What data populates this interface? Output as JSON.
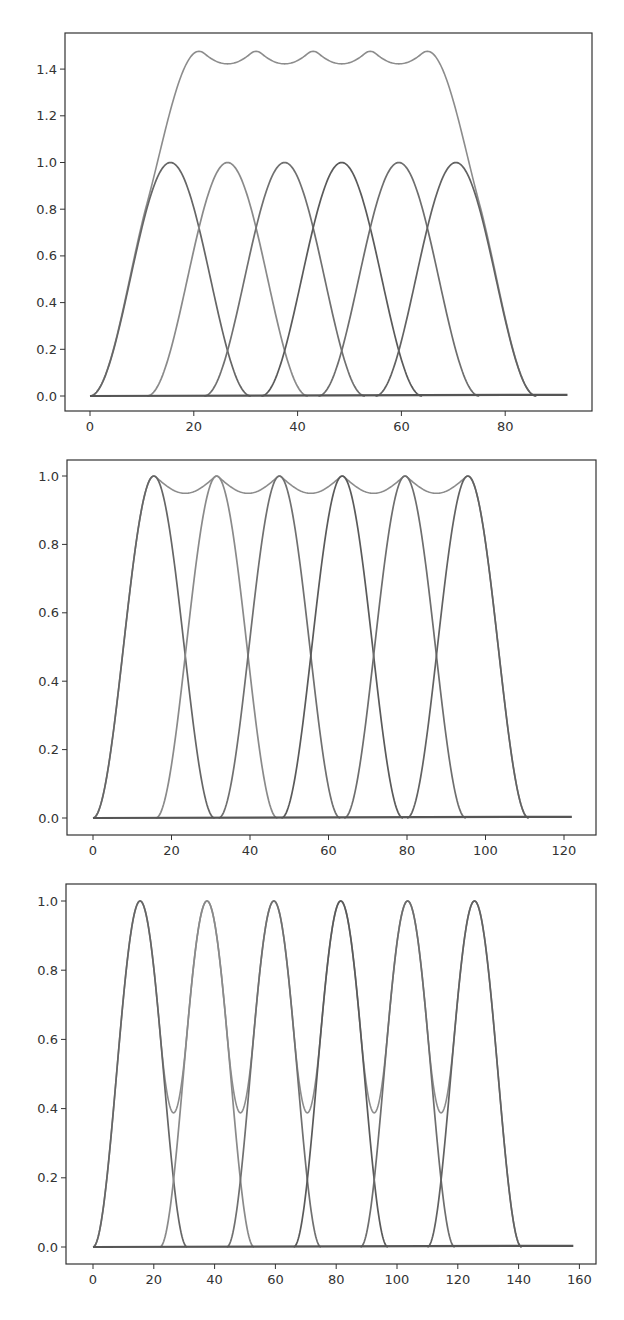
{
  "chart_data": [
    {
      "type": "line",
      "title": "",
      "xlabel": "",
      "ylabel": "",
      "xlim": [
        -5,
        97
      ],
      "ylim": [
        -0.07,
        1.55
      ],
      "grid": false,
      "legend": null,
      "xticks": [
        0,
        20,
        40,
        60,
        80
      ],
      "yticks": [
        0.0,
        0.2,
        0.4,
        0.6,
        0.8,
        1.0,
        1.2,
        1.4
      ],
      "ytick_labels": [
        "0.0",
        "0.2",
        "0.4",
        "0.6",
        "0.8",
        "1.0",
        "1.2",
        "1.4"
      ],
      "window_shape": "raised-cosine",
      "window_width": 31,
      "peak_centers": [
        15.5,
        26.5,
        37.5,
        48.5,
        59.5,
        70.5
      ],
      "baseline_x_range": [
        0,
        92
      ],
      "series_colors": [
        "#666666",
        "#8a8a8a",
        "#707070",
        "#5a5a5a",
        "#6e6e6e",
        "#626262"
      ],
      "sum_color": "#8c8c8c",
      "sum_peak": 1.48,
      "sum_dip": 1.46,
      "individual_peak": 1.0,
      "crossing_value": 0.73,
      "series": [
        {
          "name": "window 1",
          "center": 15.5,
          "start": 0,
          "end": 31,
          "peak": 1.0
        },
        {
          "name": "window 2",
          "center": 26.5,
          "start": 11,
          "end": 42,
          "peak": 1.0
        },
        {
          "name": "window 3",
          "center": 37.5,
          "start": 22,
          "end": 53,
          "peak": 1.0
        },
        {
          "name": "window 4",
          "center": 48.5,
          "start": 33,
          "end": 64,
          "peak": 1.0
        },
        {
          "name": "window 5",
          "center": 59.5,
          "start": 44,
          "end": 75,
          "peak": 1.0
        },
        {
          "name": "window 6",
          "center": 70.5,
          "start": 55,
          "end": 86,
          "peak": 1.0
        },
        {
          "name": "sum",
          "x": [
            0,
            5,
            10,
            15,
            20,
            21,
            26,
            32,
            37,
            43,
            48,
            54,
            59,
            65,
            70,
            75,
            80,
            86,
            92
          ],
          "values": [
            0.0,
            0.25,
            0.79,
            1.25,
            1.46,
            1.48,
            1.46,
            1.48,
            1.46,
            1.48,
            1.46,
            1.48,
            1.46,
            1.48,
            1.25,
            0.79,
            0.25,
            0.0,
            0.0
          ]
        }
      ]
    },
    {
      "type": "line",
      "title": "",
      "xlabel": "",
      "ylabel": "",
      "xlim": [
        -6,
        128
      ],
      "ylim": [
        -0.05,
        1.05
      ],
      "grid": false,
      "legend": null,
      "xticks": [
        0,
        20,
        40,
        60,
        80,
        100,
        120
      ],
      "yticks": [
        0.0,
        0.2,
        0.4,
        0.6,
        0.8,
        1.0
      ],
      "ytick_labels": [
        "0.0",
        "0.2",
        "0.4",
        "0.6",
        "0.8",
        "1.0"
      ],
      "window_shape": "raised-cosine",
      "window_width": 31,
      "peak_centers": [
        15.5,
        31.5,
        47.5,
        63.5,
        79.5,
        95.5
      ],
      "baseline_x_range": [
        0,
        122
      ],
      "series_colors": [
        "#666666",
        "#8a8a8a",
        "#707070",
        "#5a5a5a",
        "#6e6e6e",
        "#626262"
      ],
      "sum_color": "#8c8c8c",
      "crossing_value": 0.5,
      "series": [
        {
          "name": "window 1",
          "center": 15.5,
          "start": 0,
          "end": 31,
          "peak": 1.0
        },
        {
          "name": "window 2",
          "center": 31.5,
          "start": 16,
          "end": 47,
          "peak": 1.0
        },
        {
          "name": "window 3",
          "center": 47.5,
          "start": 32,
          "end": 63,
          "peak": 1.0
        },
        {
          "name": "window 4",
          "center": 63.5,
          "start": 48,
          "end": 79,
          "peak": 1.0
        },
        {
          "name": "window 5",
          "center": 79.5,
          "start": 64,
          "end": 95,
          "peak": 1.0
        },
        {
          "name": "window 6",
          "center": 95.5,
          "start": 80,
          "end": 111,
          "peak": 1.0
        },
        {
          "name": "sum",
          "x": [
            0,
            5,
            10,
            15.5,
            31.5,
            47.5,
            63.5,
            79.5,
            95.5,
            101,
            106,
            111,
            122
          ],
          "values": [
            0.0,
            0.28,
            0.77,
            1.0,
            1.0,
            1.0,
            1.0,
            1.0,
            1.0,
            0.77,
            0.28,
            0.0,
            0.0
          ]
        }
      ]
    },
    {
      "type": "line",
      "title": "",
      "xlabel": "",
      "ylabel": "",
      "xlim": [
        -8,
        166
      ],
      "ylim": [
        -0.05,
        1.05
      ],
      "grid": false,
      "legend": null,
      "xticks": [
        0,
        20,
        40,
        60,
        80,
        100,
        120,
        140,
        160
      ],
      "yticks": [
        0.0,
        0.2,
        0.4,
        0.6,
        0.8,
        1.0
      ],
      "ytick_labels": [
        "0.0",
        "0.2",
        "0.4",
        "0.6",
        "0.8",
        "1.0"
      ],
      "window_shape": "raised-cosine",
      "window_width": 31,
      "peak_centers": [
        15.5,
        37.5,
        59.5,
        81.5,
        103.5,
        125.5
      ],
      "baseline_x_range": [
        0,
        158
      ],
      "series_colors": [
        "#666666",
        "#8a8a8a",
        "#707070",
        "#5a5a5a",
        "#6e6e6e",
        "#626262"
      ],
      "sum_color": "#8c8c8c",
      "crossing_value": 0.2,
      "sum_dip": 0.45,
      "series": [
        {
          "name": "window 1",
          "center": 15.5,
          "start": 0,
          "end": 31,
          "peak": 1.0
        },
        {
          "name": "window 2",
          "center": 37.5,
          "start": 22,
          "end": 53,
          "peak": 1.0
        },
        {
          "name": "window 3",
          "center": 59.5,
          "start": 44,
          "end": 75,
          "peak": 1.0
        },
        {
          "name": "window 4",
          "center": 81.5,
          "start": 66,
          "end": 97,
          "peak": 1.0
        },
        {
          "name": "window 5",
          "center": 103.5,
          "start": 88,
          "end": 119,
          "peak": 1.0
        },
        {
          "name": "window 6",
          "center": 125.5,
          "start": 110,
          "end": 141,
          "peak": 1.0
        },
        {
          "name": "sum",
          "x": [
            0,
            15.5,
            26.5,
            37.5,
            48.5,
            59.5,
            70.5,
            81.5,
            92.5,
            103.5,
            114.5,
            125.5,
            141,
            158
          ],
          "values": [
            0.0,
            1.0,
            0.45,
            1.0,
            0.45,
            1.0,
            0.45,
            1.0,
            0.45,
            1.0,
            0.45,
            1.0,
            0.0,
            0.0
          ]
        }
      ]
    }
  ],
  "layout": {
    "panels": [
      {
        "top": 0,
        "height": 440,
        "frame": {
          "left": 65,
          "top": 33,
          "right": 592,
          "bottom": 411
        },
        "x0_px": 90,
        "x_px_per_unit": 5.19,
        "y0_px": 396,
        "y_px_per_unit": 233.5
      },
      {
        "top": 440,
        "height": 430,
        "frame": {
          "left": 67,
          "top": 20,
          "right": 596,
          "bottom": 395
        },
        "x0_px": 93,
        "x_px_per_unit": 3.925,
        "y0_px": 378,
        "y_px_per_unit": 342
      },
      {
        "top": 870,
        "height": 450,
        "frame": {
          "left": 66,
          "top": 14,
          "right": 596,
          "bottom": 394
        },
        "x0_px": 93,
        "x_px_per_unit": 3.04,
        "y0_px": 377,
        "y_px_per_unit": 346
      }
    ]
  }
}
